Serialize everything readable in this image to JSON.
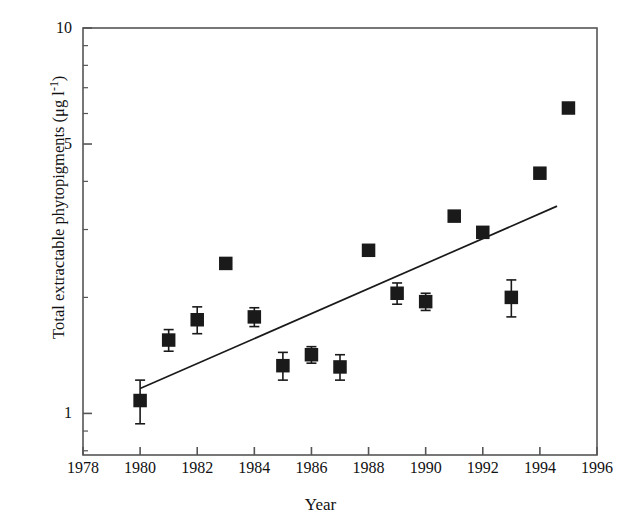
{
  "chart_data": {
    "type": "scatter",
    "title": "",
    "xlabel": "Year",
    "ylabel": "Total extractable phytopigments (μg l⁻¹)",
    "ylabel_parts": {
      "main": "Total extractable phytopigments (",
      "mu": "μ",
      "g": "g l",
      "exp": "-1",
      "close": ")"
    },
    "xlim": [
      1978,
      1996
    ],
    "ylim": [
      0.78,
      10
    ],
    "yscale": "log",
    "xscale": "linear",
    "grid": false,
    "legend": false,
    "xticks": [
      1978,
      1980,
      1982,
      1984,
      1986,
      1988,
      1990,
      1992,
      1994,
      1996
    ],
    "xticklabels": [
      "1978",
      "1980",
      "1982",
      "1984",
      "1986",
      "1988",
      "1990",
      "1992",
      "1994",
      "1996"
    ],
    "yticks": [
      1,
      5,
      10
    ],
    "yticklabels": [
      "1",
      "5",
      "10"
    ],
    "yminorticks": [
      2,
      3,
      4,
      6,
      7,
      8,
      9,
      0.9,
      0.8
    ],
    "marker": "filled-square",
    "marker_color": "#1a1a1a",
    "line_color": "#1a1a1a",
    "frame_color": "#555555",
    "x": [
      1980,
      1981,
      1982,
      1983,
      1984,
      1985,
      1986,
      1987,
      1988,
      1989,
      1990,
      1991,
      1992,
      1993,
      1994,
      1995
    ],
    "values": [
      1.08,
      1.55,
      1.75,
      2.45,
      1.78,
      1.33,
      1.42,
      1.32,
      2.65,
      2.05,
      1.95,
      3.25,
      2.95,
      2.0,
      4.2,
      6.2
    ],
    "errors": [
      0.14,
      0.1,
      0.14,
      0,
      0.1,
      0.11,
      0.07,
      0.1,
      0,
      0.13,
      0.1,
      0,
      0,
      0.22,
      0,
      0
    ],
    "series": [
      {
        "name": "Total extractable phytopigments",
        "values": [
          1.08,
          1.55,
          1.75,
          2.45,
          1.78,
          1.33,
          1.42,
          1.32,
          2.65,
          2.05,
          1.95,
          3.25,
          2.95,
          2.0,
          4.2,
          6.2
        ]
      }
    ],
    "trendline": {
      "x_start": 1980,
      "y_start": 1.16,
      "x_end": 1994.6,
      "y_end": 3.45
    }
  }
}
